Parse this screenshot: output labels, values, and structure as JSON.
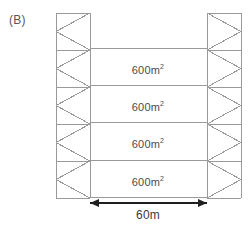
{
  "figure": {
    "label": "(B)",
    "background_color": "#ffffff",
    "line_color": "#9a9a9a",
    "arrow_color": "#1f1f1f",
    "text_color": "#4b4b4b"
  },
  "columns": {
    "left": {
      "x_start": 56,
      "x_end": 90
    },
    "right": {
      "x_start": 207,
      "x_end": 241
    },
    "y_top": 13,
    "y_bottom": 198,
    "panel_count": 5,
    "bracing": "zigzag-triangular"
  },
  "grid": {
    "divider_y": [
      48,
      85,
      122,
      160,
      197
    ],
    "left_x": 90,
    "right_x": 207
  },
  "cells": [
    {
      "area_value": "600",
      "unit": "m",
      "exponent": "2",
      "center_x": 148,
      "center_y": 70
    },
    {
      "area_value": "600",
      "unit": "m",
      "exponent": "2",
      "center_x": 148,
      "center_y": 107
    },
    {
      "area_value": "600",
      "unit": "m",
      "exponent": "2",
      "center_x": 148,
      "center_y": 144
    },
    {
      "area_value": "600",
      "unit": "m",
      "exponent": "2",
      "center_x": 148,
      "center_y": 182
    }
  ],
  "dimension": {
    "label": "60m",
    "x_start": 90,
    "x_end": 207,
    "y": 203,
    "label_center_x": 148,
    "label_y": 208
  }
}
